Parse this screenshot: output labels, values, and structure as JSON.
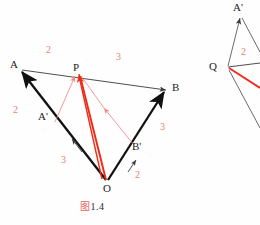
{
  "figure": {
    "caption": "图 1.4",
    "caption_prefix": "图",
    "caption_number": "1.4",
    "colors": {
      "vector_black": "#111111",
      "line_thin": "#3a3a3a",
      "accent_red": "#ee2b18",
      "label_red": "#ec7e72",
      "text": "#1d1d1d",
      "background": "#fefefe"
    }
  },
  "main_diagram": {
    "points": [
      {
        "name": "point-A",
        "label": "A",
        "x": 15,
        "y": 67
      },
      {
        "name": "point-P",
        "label": "P",
        "x": 78,
        "y": 70
      },
      {
        "name": "point-B",
        "label": "B",
        "x": 168,
        "y": 88
      },
      {
        "name": "point-O",
        "label": "O",
        "x": 107,
        "y": 183
      },
      {
        "name": "point-Aprime",
        "label": "A'",
        "x": 45,
        "y": 118
      },
      {
        "name": "point-Bprime",
        "label": "B'",
        "x": 137,
        "y": 148
      }
    ],
    "ratio_labels": [
      {
        "name": "ratio-AP",
        "value": "2",
        "x": 48,
        "y": 50
      },
      {
        "name": "ratio-PB",
        "value": "3",
        "x": 118,
        "y": 57
      },
      {
        "name": "ratio-OA-upper",
        "value": "2",
        "x": 15,
        "y": 110
      },
      {
        "name": "ratio-OA-lower",
        "value": "3",
        "x": 63,
        "y": 160
      },
      {
        "name": "ratio-OB-upper",
        "value": "3",
        "x": 162,
        "y": 127
      },
      {
        "name": "ratio-OB-lower",
        "value": "2",
        "x": 137,
        "y": 175
      }
    ],
    "segments": {
      "OA": "thick black vector O to A",
      "OB": "thick black vector O to B",
      "AB": "thin line A to B through P",
      "AprimeP": "red thin arrow A' to P",
      "BprimeP": "red thin arrow B' to P",
      "PO": "red thick vector P to O",
      "PAprime_thin": "thin arrow toward A'",
      "PBprime_thin": "thin arrow toward B'"
    }
  },
  "side_diagram": {
    "points": [
      {
        "name": "point-Q",
        "label": "Q",
        "x": 215,
        "y": 68
      },
      {
        "name": "point-Aprime2",
        "label": "A'",
        "x": 236,
        "y": 6
      }
    ],
    "ratio_labels": [
      {
        "name": "ratio-side",
        "value": "2",
        "x": 243,
        "y": 52
      }
    ]
  }
}
